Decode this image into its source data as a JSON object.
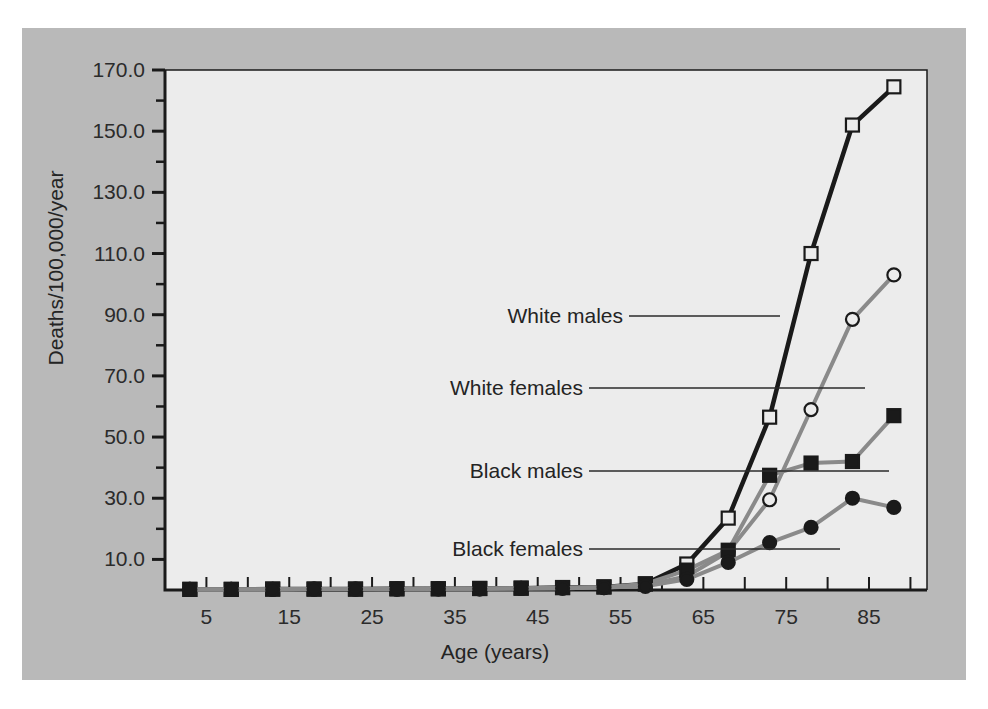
{
  "chart_data": {
    "type": "line",
    "title": "",
    "xlabel": "Age (years)",
    "ylabel": "Deaths/100,000/year",
    "xlim": [
      0,
      92
    ],
    "ylim": [
      0,
      170
    ],
    "xticks": [
      5,
      15,
      25,
      35,
      45,
      55,
      65,
      75,
      85
    ],
    "xtick_labels": [
      "5",
      "15",
      "25",
      "35",
      "45",
      "55",
      "65",
      "75",
      "85"
    ],
    "xminor_step": 5,
    "yticks": [
      10,
      30,
      50,
      70,
      90,
      110,
      130,
      150,
      170
    ],
    "ytick_labels": [
      "10.0",
      "30.0",
      "50.0",
      "70.0",
      "90.0",
      "110.0",
      "130.0",
      "150.0",
      "170.0"
    ],
    "yminor_step": 10,
    "grid": false,
    "legend_position": "inline-callouts",
    "x": [
      3,
      8,
      13,
      18,
      23,
      28,
      33,
      38,
      43,
      48,
      53,
      58,
      63,
      68,
      73,
      78,
      83,
      88
    ],
    "series": [
      {
        "name": "White males",
        "marker": "open-square",
        "line_color": "#1a1a1a",
        "marker_fill": "#ececec",
        "marker_edge": "#1a1a1a",
        "values": [
          0.2,
          0.2,
          0.3,
          0.3,
          0.3,
          0.4,
          0.4,
          0.5,
          0.6,
          0.8,
          1.0,
          2.0,
          8.5,
          23.5,
          56.5,
          110.0,
          152.0,
          164.5
        ]
      },
      {
        "name": "White females",
        "marker": "open-circle",
        "line_color": "#8a8a8a",
        "marker_fill": "#ececec",
        "marker_edge": "#1a1a1a",
        "values": [
          0.2,
          0.2,
          0.2,
          0.3,
          0.3,
          0.3,
          0.4,
          0.4,
          0.5,
          0.6,
          0.8,
          1.5,
          4.5,
          12.5,
          29.5,
          59.0,
          88.5,
          103.0
        ]
      },
      {
        "name": "Black males",
        "marker": "filled-square",
        "line_color": "#8a8a8a",
        "marker_fill": "#1a1a1a",
        "marker_edge": "#1a1a1a",
        "values": [
          0.2,
          0.2,
          0.3,
          0.3,
          0.3,
          0.4,
          0.4,
          0.5,
          0.6,
          0.8,
          1.0,
          2.0,
          6.5,
          13.0,
          37.5,
          41.5,
          42.0,
          57.0
        ]
      },
      {
        "name": "Black females",
        "marker": "filled-circle",
        "line_color": "#8a8a8a",
        "marker_fill": "#1a1a1a",
        "marker_edge": "#1a1a1a",
        "values": [
          0.2,
          0.2,
          0.2,
          0.3,
          0.3,
          0.3,
          0.4,
          0.4,
          0.5,
          0.6,
          0.8,
          1.2,
          3.5,
          9.0,
          15.5,
          20.5,
          30.0,
          27.0
        ]
      }
    ],
    "annotations": [
      {
        "text": "White males",
        "label_x": 601,
        "label_y": 288,
        "leader_to_x": 758,
        "leader_to_y": 288
      },
      {
        "text": "White females",
        "label_x": 561,
        "label_y": 360,
        "leader_to_x": 843,
        "leader_to_y": 360
      },
      {
        "text": "Black males",
        "label_x": 561,
        "label_y": 443,
        "leader_to_x": 867,
        "leader_to_y": 443
      },
      {
        "text": "Black females",
        "label_x": 561,
        "label_y": 521,
        "leader_to_x": 818,
        "leader_to_y": 521
      }
    ]
  },
  "colors": {
    "figure_background": "#b9b9b9",
    "plot_background": "#ececec",
    "axis": "#1a1a1a",
    "text": "#242424",
    "page_background": "#ffffff"
  }
}
